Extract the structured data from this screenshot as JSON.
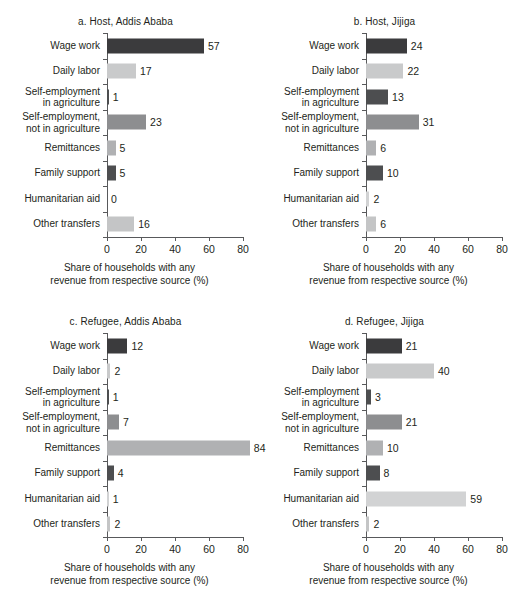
{
  "figure": {
    "axis_title": "Share of households with any\nrevenue from respective source (%)",
    "axis_title_line1": "Share of households with any",
    "axis_title_line2": "revenue from respective source (%)"
  },
  "categories": [
    "Wage work",
    "Daily labor",
    "Self-employment\nin agriculture",
    "Self-employment,\nnot in agriculture",
    "Remittances",
    "Family support",
    "Humanitarian aid",
    "Other transfers"
  ],
  "category_lines": [
    [
      "Wage work"
    ],
    [
      "Daily labor"
    ],
    [
      "Self-employment",
      "in agriculture"
    ],
    [
      "Self-employment,",
      "not in agriculture"
    ],
    [
      "Remittances"
    ],
    [
      "Family support"
    ],
    [
      "Humanitarian aid"
    ],
    [
      "Other transfers"
    ]
  ],
  "colors": {
    "wage_work": "#3b3b3d",
    "daily_labor": "#c9cacb",
    "self_emp_agri": "#4d4e50",
    "self_emp_nonagri": "#8d8e90",
    "remittances": "#b0b1b3",
    "family_support": "#4d4e50",
    "humanitarian_aid": "#d2d3d4",
    "other_transfers": "#c4c5c6",
    "axis": "#58595b",
    "text": "#231f20",
    "background": "#ffffff"
  },
  "bar_colors": [
    "#3b3b3d",
    "#c9cacb",
    "#4d4e50",
    "#8d8e90",
    "#b0b1b3",
    "#4d4e50",
    "#d2d3d4",
    "#c4c5c6"
  ],
  "axis": {
    "ticks": [
      0,
      20,
      40,
      60,
      80
    ],
    "tick_labels": [
      "0",
      "20",
      "40",
      "60",
      "80"
    ],
    "xlim": [
      0,
      80
    ]
  },
  "chart_data": [
    {
      "type": "bar",
      "panel": "a",
      "title": "a. Host, Addis Ababa",
      "orientation": "horizontal",
      "categories": [
        "Wage work",
        "Daily labor",
        "Self-employment in agriculture",
        "Self-employment, not in agriculture",
        "Remittances",
        "Family support",
        "Humanitarian aid",
        "Other transfers"
      ],
      "values": [
        57,
        17,
        1,
        23,
        5,
        5,
        0,
        16
      ],
      "value_labels": [
        "57",
        "17",
        "1",
        "23",
        "5",
        "5",
        "0",
        "16"
      ],
      "xlabel": "Share of households with any revenue from respective source (%)",
      "ylabel": "",
      "xlim": [
        0,
        80
      ],
      "xticks": [
        0,
        20,
        40,
        60,
        80
      ],
      "grid": false,
      "legend": "none"
    },
    {
      "type": "bar",
      "panel": "b",
      "title": "b. Host, Jijiga",
      "orientation": "horizontal",
      "categories": [
        "Wage work",
        "Daily labor",
        "Self-employment in agriculture",
        "Self-employment, not in agriculture",
        "Remittances",
        "Family support",
        "Humanitarian aid",
        "Other transfers"
      ],
      "values": [
        24,
        22,
        13,
        31,
        6,
        10,
        2,
        6
      ],
      "value_labels": [
        "24",
        "22",
        "13",
        "31",
        "6",
        "10",
        "2",
        "6"
      ],
      "xlabel": "Share of households with any revenue from respective source (%)",
      "ylabel": "",
      "xlim": [
        0,
        80
      ],
      "xticks": [
        0,
        20,
        40,
        60,
        80
      ],
      "grid": false,
      "legend": "none"
    },
    {
      "type": "bar",
      "panel": "c",
      "title": "c. Refugee, Addis Ababa",
      "orientation": "horizontal",
      "categories": [
        "Wage work",
        "Daily labor",
        "Self-employment in agriculture",
        "Self-employment, not in agriculture",
        "Remittances",
        "Family support",
        "Humanitarian aid",
        "Other transfers"
      ],
      "values": [
        12,
        2,
        1,
        7,
        84,
        4,
        1,
        2
      ],
      "value_labels": [
        "12",
        "2",
        "1",
        "7",
        "84",
        "4",
        "1",
        "2"
      ],
      "xlabel": "Share of households with any revenue from respective source (%)",
      "ylabel": "",
      "xlim": [
        0,
        80
      ],
      "xticks": [
        0,
        20,
        40,
        60,
        80
      ],
      "grid": false,
      "legend": "none"
    },
    {
      "type": "bar",
      "panel": "d",
      "title": "d. Refugee, Jijiga",
      "orientation": "horizontal",
      "categories": [
        "Wage work",
        "Daily labor",
        "Self-employment in agriculture",
        "Self-employment, not in agriculture",
        "Remittances",
        "Family support",
        "Humanitarian aid",
        "Other transfers"
      ],
      "values": [
        21,
        40,
        3,
        21,
        10,
        8,
        59,
        2
      ],
      "value_labels": [
        "21",
        "40",
        "3",
        "21",
        "10",
        "8",
        "59",
        "2"
      ],
      "xlabel": "Share of households with any revenue from respective source (%)",
      "ylabel": "",
      "xlim": [
        0,
        80
      ],
      "xticks": [
        0,
        20,
        40,
        60,
        80
      ],
      "grid": false,
      "legend": "none"
    }
  ]
}
